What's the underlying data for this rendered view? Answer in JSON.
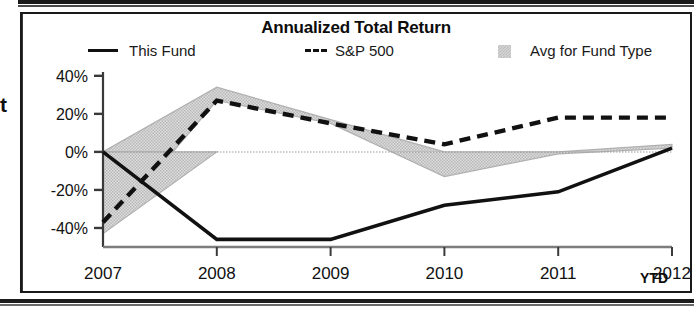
{
  "chart_data": {
    "type": "line",
    "title": "Annualized Total Return",
    "xlabel": "",
    "ylabel": "",
    "categories": [
      "2007",
      "2008",
      "2009",
      "2010",
      "2011",
      "2012"
    ],
    "x_axis_suffix": "YTD",
    "ytick_labels": [
      "40%",
      "20%",
      "0%",
      "-20%",
      "-40%"
    ],
    "ytick_values": [
      40,
      20,
      0,
      -20,
      -40
    ],
    "ylim": [
      -50,
      42
    ],
    "grid": false,
    "zero_line": true,
    "legend_position": "top",
    "series": [
      {
        "name": "This Fund",
        "style": "solid",
        "color": "#111111",
        "values": [
          0,
          -46,
          -46,
          -28,
          -21,
          2
        ]
      },
      {
        "name": "S&P 500",
        "style": "dashed",
        "color": "#111111",
        "values": [
          -37,
          27,
          15,
          4,
          18,
          18
        ]
      },
      {
        "name": "Avg for Fund Type",
        "style": "band",
        "color": "#cccccc",
        "band_upper": [
          0,
          34,
          17,
          0,
          0,
          4
        ],
        "band_lower": [
          -43,
          27,
          15,
          -13,
          -1,
          2
        ]
      }
    ]
  },
  "legend": {
    "items": [
      {
        "label": "This Fund",
        "marker": "solid-line-swatch"
      },
      {
        "label": "S&P 500",
        "marker": "dashed-line-swatch"
      },
      {
        "label": "Avg for Fund Type",
        "marker": "gray-band-swatch"
      }
    ]
  },
  "artifacts": {
    "left_text_fragment": "t"
  },
  "colors": {
    "line": "#111111",
    "band_fill": "#d6d6d6",
    "band_edge": "#b0b0b0",
    "axis": "#3a3a3a",
    "text": "#111111"
  }
}
